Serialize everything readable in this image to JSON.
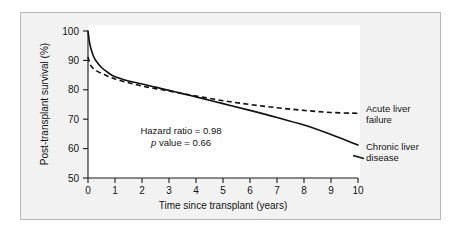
{
  "chart_data": {
    "type": "line",
    "title": "",
    "xlabel": "Time since transplant (years)",
    "ylabel": "Post-transplant survival (%)",
    "xlim": [
      0,
      10
    ],
    "ylim": [
      50,
      100
    ],
    "xticks": [
      "0",
      "1",
      "2",
      "3",
      "4",
      "5",
      "6",
      "7",
      "8",
      "9",
      "10"
    ],
    "yticks": [
      "50",
      "60",
      "70",
      "80",
      "90",
      "100"
    ],
    "grid": false,
    "legend_position": "right-inline-labels",
    "series": [
      {
        "name": "Chronic liver disease",
        "style": "solid",
        "color": "#111111",
        "x": [
          0,
          0.05,
          0.1,
          0.2,
          0.3,
          0.5,
          0.75,
          1,
          1.5,
          2,
          2.5,
          3,
          3.5,
          4,
          5,
          6,
          7,
          8,
          9,
          10
        ],
        "y": [
          100,
          96.5,
          94.3,
          91.5,
          89.8,
          87.6,
          85.8,
          84.4,
          83.0,
          82.0,
          80.9,
          79.8,
          78.7,
          77.6,
          75.3,
          73.0,
          70.6,
          68.0,
          64.8,
          61.2
        ]
      },
      {
        "name": "Acute liver failure",
        "style": "dashed",
        "color": "#111111",
        "x": [
          0,
          0.05,
          0.1,
          0.2,
          0.4,
          0.6,
          0.8,
          1,
          1.5,
          2,
          2.5,
          3,
          3.5,
          4,
          5,
          6,
          7,
          8,
          9,
          10
        ],
        "y": [
          91.2,
          89.5,
          88.3,
          87.2,
          86.0,
          85.2,
          84.4,
          83.7,
          82.4,
          81.3,
          80.4,
          79.6,
          78.7,
          77.9,
          76.3,
          75.0,
          73.9,
          73.0,
          72.3,
          72.0
        ]
      }
    ],
    "annotations": [
      {
        "text": "Hazard ratio = 0.98"
      },
      {
        "text_italic": "p",
        "text": " value = 0.66"
      }
    ],
    "series_labels": [
      {
        "label_line1": "Acute liver",
        "label_line2": "failure"
      },
      {
        "label_line1": "Chronic liver",
        "label_line2": "disease"
      }
    ]
  }
}
